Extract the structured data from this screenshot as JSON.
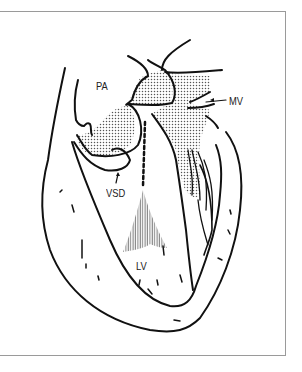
{
  "figure": {
    "type": "anatomical line drawing",
    "labels": {
      "pa": "PA",
      "mv": "MV",
      "vsd": "VSD",
      "lv": "LV"
    }
  },
  "colors": {
    "stroke": "#111111",
    "stipple": "#555555",
    "frame": "#9a9a9a",
    "background": "#ffffff"
  }
}
